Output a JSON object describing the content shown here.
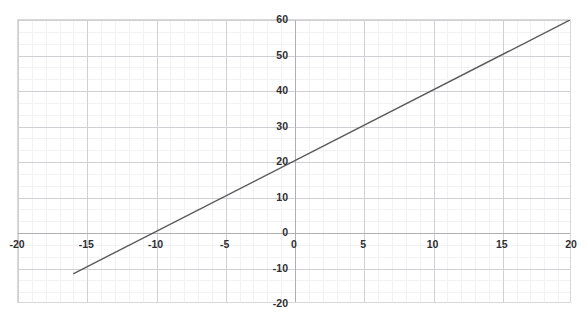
{
  "top_text": "",
  "chart_data": {
    "type": "line",
    "title": "",
    "subtitle": "",
    "xlabel": "",
    "ylabel": "",
    "xlim": [
      -20,
      20
    ],
    "ylim": [
      -20,
      60
    ],
    "xticks": [
      -20,
      -15,
      -10,
      -5,
      0,
      5,
      10,
      15,
      20
    ],
    "xtick_labels": [
      "-20",
      "-15",
      "-10",
      "-5",
      "0",
      "5",
      "10",
      "15",
      "20"
    ],
    "yticks": [
      -20,
      -10,
      0,
      10,
      20,
      30,
      40,
      50,
      60
    ],
    "ytick_labels": [
      "-20",
      "-10",
      "0",
      "10",
      "20",
      "30",
      "40",
      "50",
      "60"
    ],
    "grid": true,
    "grid_major_step_x": 5,
    "grid_major_step_y": 10,
    "grid_minor_step_x": 1,
    "grid_minor_step_y": 3.333,
    "legend": null,
    "legend_position": "none",
    "axis_lines": {
      "x_axis_at_y": 0,
      "y_axis_at_x": 0
    },
    "series": [
      {
        "name": "y = 2x + 20",
        "equation": "y = 2x + 20",
        "slope": 2,
        "intercept": 20,
        "color": "#5a5a5a",
        "x": [
          -16,
          20
        ],
        "values": [
          -12,
          60
        ],
        "points": [
          {
            "x": -16,
            "y": -12
          },
          {
            "x": -10,
            "y": 0
          },
          {
            "x": 0,
            "y": 20
          },
          {
            "x": 5,
            "y": 30
          },
          {
            "x": 10,
            "y": 40
          },
          {
            "x": 15,
            "y": 50
          },
          {
            "x": 20,
            "y": 60
          }
        ],
        "x_intercept": -10,
        "y_intercept": 20
      }
    ],
    "colors": {
      "line": "#5a5a5a",
      "grid_major": "#cfcfd4",
      "grid_minor": "#f2f2f5",
      "axis": "#b0b0b4",
      "border": "#d8d8d8",
      "tick_text": "#2f2f33",
      "background": "#ffffff"
    }
  }
}
